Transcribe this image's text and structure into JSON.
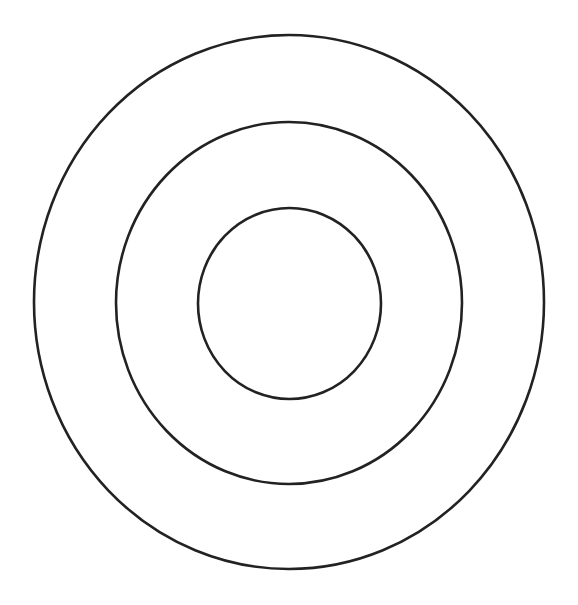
{
  "diagram": {
    "type": "concentric-rings",
    "stroke_color": "#222222",
    "stroke_width": 2.6,
    "fill": "none",
    "background": "#ffffff",
    "rings": [
      {
        "name": "outer-ring",
        "cx": 289,
        "cy": 302,
        "rx": 255,
        "ry": 267
      },
      {
        "name": "middle-ring",
        "cx": 289,
        "cy": 303,
        "rx": 173,
        "ry": 181
      },
      {
        "name": "inner-ring",
        "cx": 289.5,
        "cy": 303.5,
        "rx": 91.5,
        "ry": 95.5
      }
    ]
  }
}
